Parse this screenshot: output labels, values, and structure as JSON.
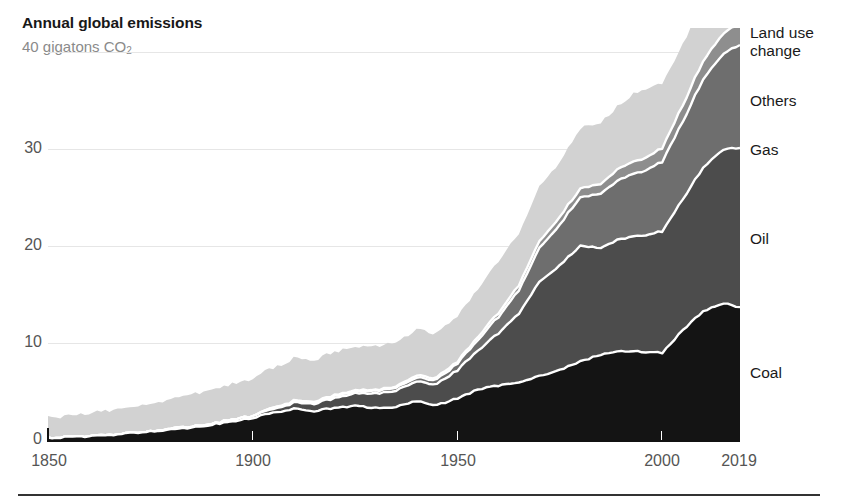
{
  "header": {
    "title": "Annual global emissions",
    "subtitle_value": "40 gigatons CO",
    "subtitle_sub": "2"
  },
  "axis": {
    "y_ticks": [
      "0",
      "10",
      "20",
      "30"
    ],
    "y_top_implied": "40",
    "x_ticks": [
      "1850",
      "1900",
      "1950",
      "2000",
      "2019"
    ]
  },
  "series_labels": {
    "land_use_change": "Land use\nchange",
    "others": "Others",
    "gas": "Gas",
    "oil": "Oil",
    "coal": "Coal"
  },
  "colors": {
    "coal": "#141414",
    "oil": "#4c4c4c",
    "gas": "#6e6e6e",
    "others": "#8e8e8e",
    "land_use_change": "#d2d2d2",
    "separator": "#ffffff",
    "gridline": "#e6e6e6",
    "axis_text": "#555555",
    "title_text": "#181818",
    "subtitle_text": "#8a8a8a"
  },
  "chart_data": {
    "type": "area",
    "title": "Annual global emissions",
    "subtitle": "40 gigatons CO2",
    "xlabel": "",
    "ylabel": "gigatons CO2",
    "xlim": [
      1850,
      2019
    ],
    "ylim": [
      0,
      42
    ],
    "grid": true,
    "stacked": true,
    "legend_position": "right-inline",
    "y_ticks": [
      0,
      10,
      20,
      30,
      40
    ],
    "x_ticks": [
      1850,
      1900,
      1950,
      2000,
      2019
    ],
    "x": [
      1850,
      1855,
      1860,
      1865,
      1870,
      1875,
      1880,
      1885,
      1890,
      1895,
      1900,
      1905,
      1910,
      1915,
      1920,
      1925,
      1930,
      1935,
      1940,
      1945,
      1950,
      1955,
      1960,
      1965,
      1970,
      1975,
      1980,
      1985,
      1990,
      1995,
      2000,
      2005,
      2010,
      2015,
      2019
    ],
    "series": [
      {
        "name": "Coal",
        "values": [
          0.2,
          0.3,
          0.4,
          0.5,
          0.7,
          0.9,
          1.1,
          1.3,
          1.6,
          1.9,
          2.3,
          2.8,
          3.2,
          3.0,
          3.3,
          3.5,
          3.3,
          3.4,
          4.0,
          3.6,
          4.3,
          5.2,
          5.6,
          6.0,
          6.6,
          7.2,
          8.1,
          8.8,
          9.2,
          9.1,
          9.0,
          11.3,
          13.3,
          14.1,
          13.7
        ]
      },
      {
        "name": "Oil",
        "values": [
          0.0,
          0.0,
          0.0,
          0.0,
          0.0,
          0.0,
          0.1,
          0.1,
          0.1,
          0.2,
          0.2,
          0.4,
          0.6,
          0.8,
          1.0,
          1.3,
          1.5,
          1.7,
          2.0,
          2.2,
          2.9,
          4.0,
          5.4,
          7.1,
          9.7,
          10.8,
          11.9,
          11.0,
          11.6,
          12.0,
          12.5,
          13.5,
          14.8,
          15.9,
          16.4
        ]
      },
      {
        "name": "Gas",
        "values": [
          0.0,
          0.0,
          0.0,
          0.0,
          0.0,
          0.0,
          0.0,
          0.0,
          0.0,
          0.0,
          0.0,
          0.1,
          0.1,
          0.1,
          0.2,
          0.2,
          0.3,
          0.3,
          0.4,
          0.5,
          0.7,
          1.1,
          1.7,
          2.4,
          3.5,
          4.2,
          5.0,
          5.6,
          6.2,
          6.6,
          7.2,
          8.0,
          9.1,
          9.9,
          10.6
        ]
      },
      {
        "name": "Others",
        "values": [
          0.0,
          0.0,
          0.0,
          0.0,
          0.0,
          0.0,
          0.0,
          0.0,
          0.0,
          0.0,
          0.0,
          0.0,
          0.1,
          0.1,
          0.1,
          0.1,
          0.1,
          0.1,
          0.2,
          0.2,
          0.2,
          0.3,
          0.4,
          0.5,
          0.7,
          0.8,
          0.9,
          1.0,
          1.2,
          1.3,
          1.4,
          1.7,
          1.9,
          2.1,
          2.2
        ]
      },
      {
        "name": "Land use change",
        "values": [
          2.1,
          2.2,
          2.4,
          2.5,
          2.7,
          2.9,
          3.1,
          3.3,
          3.5,
          3.7,
          3.9,
          4.1,
          4.3,
          4.3,
          4.4,
          4.5,
          4.5,
          4.6,
          4.7,
          4.6,
          4.8,
          5.0,
          5.2,
          5.4,
          5.6,
          5.7,
          6.2,
          6.3,
          6.6,
          7.2,
          6.6,
          6.3,
          6.0,
          5.8,
          6.1
        ]
      }
    ],
    "totals_note": "Stacked bottom-to-top: Coal, Oil, Gas, Others, Land use change",
    "value_2019_total": 49.0
  }
}
